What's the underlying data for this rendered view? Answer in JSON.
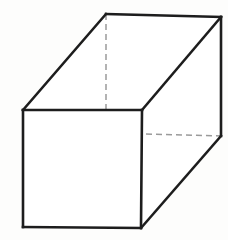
{
  "figure": {
    "kind": "line-drawing",
    "caption": "",
    "canvas": {
      "width": 228,
      "height": 240,
      "background_color": "#fdfdfc"
    },
    "style": {
      "visible_edge_color": "#1d1d1d",
      "visible_edge_width": 2.6,
      "hidden_edge_color": "#9a9a9a",
      "hidden_edge_width": 1.5,
      "hidden_edge_dash": "6 4",
      "face_fill_color": "#ffffff"
    },
    "vertices": {
      "front_top_left": {
        "label": "A",
        "x": 23,
        "y": 110
      },
      "front_top_right": {
        "label": "B",
        "x": 142,
        "y": 110
      },
      "front_bottom_right": {
        "label": "C",
        "x": 141,
        "y": 228
      },
      "front_bottom_left": {
        "label": "D",
        "x": 23,
        "y": 227
      },
      "back_top_left": {
        "label": "E",
        "x": 106,
        "y": 14
      },
      "back_top_right": {
        "label": "F",
        "x": 221,
        "y": 17
      },
      "back_bottom_right": {
        "label": "G",
        "x": 221,
        "y": 136
      },
      "back_bottom_left": {
        "label": "H",
        "x": 106,
        "y": 133
      }
    },
    "faces": [
      {
        "name": "front-face",
        "visible": true,
        "points": "23,110 142,110 141,228 23,227"
      },
      {
        "name": "top-face",
        "visible": true,
        "points": "23,110 106,14 221,17 142,110"
      },
      {
        "name": "right-face",
        "visible": true,
        "points": "142,110 221,17 221,136 141,228"
      }
    ],
    "edges_visible": [
      {
        "name": "front-top-edge",
        "points": "23,110 142,110"
      },
      {
        "name": "front-right-edge",
        "points": "142,110 141,228"
      },
      {
        "name": "front-bottom-edge",
        "points": "141,228 23,227"
      },
      {
        "name": "front-left-edge",
        "points": "23,227 23,110"
      },
      {
        "name": "top-left-receding-edge",
        "points": "23,110 106,14"
      },
      {
        "name": "back-top-edge",
        "points": "106,14 221,17"
      },
      {
        "name": "top-right-receding-edge",
        "points": "221,17 142,110"
      },
      {
        "name": "back-right-vertical-edge",
        "points": "221,17 221,136"
      },
      {
        "name": "bottom-right-receding-edge",
        "points": "221,136 141,228"
      }
    ],
    "edges_hidden": [
      {
        "name": "hidden-back-left-vertical-edge",
        "points": "106,14 106,133"
      },
      {
        "name": "hidden-back-bottom-edge",
        "points": "106,133 221,136"
      },
      {
        "name": "hidden-bottom-left-receding-edge",
        "points": "23,227 106,133"
      }
    ]
  }
}
